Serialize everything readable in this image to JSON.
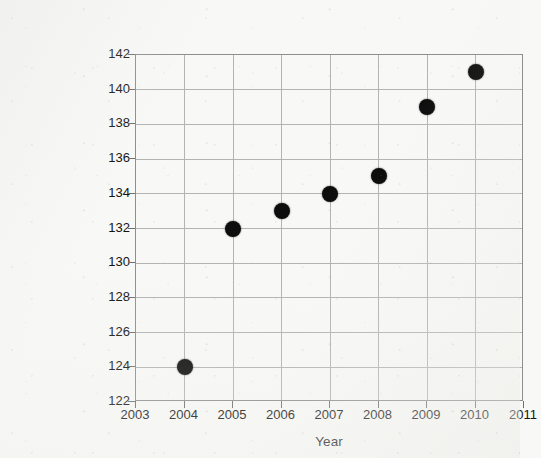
{
  "chart_data": {
    "type": "scatter",
    "title": "",
    "xlabel": "Year",
    "ylabel": "High School graduates (in thousands)",
    "x": [
      2004,
      2005,
      2006,
      2007,
      2008,
      2009,
      2010
    ],
    "values": [
      124,
      132,
      133,
      134,
      135,
      139,
      141
    ],
    "points": [
      {
        "x": 2004,
        "y": 124
      },
      {
        "x": 2005,
        "y": 132
      },
      {
        "x": 2006,
        "y": 133
      },
      {
        "x": 2007,
        "y": 134
      },
      {
        "x": 2008,
        "y": 135
      },
      {
        "x": 2009,
        "y": 139
      },
      {
        "x": 2010,
        "y": 141
      }
    ],
    "xlim": [
      2003,
      2011
    ],
    "ylim": [
      122,
      142
    ],
    "x_ticks": [
      "2003",
      "2004",
      "2005",
      "2006",
      "2007",
      "2008",
      "2009",
      "2010",
      "2011"
    ],
    "y_ticks": [
      "122",
      "124",
      "126",
      "128",
      "130",
      "132",
      "134",
      "136",
      "138",
      "140",
      "142"
    ],
    "grid": true,
    "legend": "none",
    "marker": "filled-circle",
    "marker_color": "#0d0d0d",
    "grid_color": "#b4b4b4",
    "axis_color": "#8e8e8e",
    "background_color": "#f8f8f6"
  }
}
